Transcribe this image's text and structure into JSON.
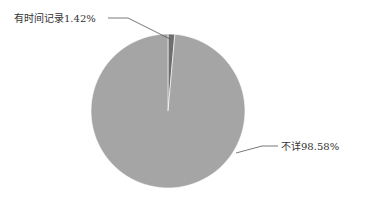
{
  "chart_data": {
    "type": "pie",
    "title": "",
    "categories": [
      "有时间记录",
      "不详"
    ],
    "values": [
      1.42,
      98.58
    ],
    "unit": "%",
    "labels": [
      "有时间记录1.42%",
      "不详98.58%"
    ],
    "colors": [
      "#6e6e6e",
      "#a5a5a5"
    ],
    "legend": "none",
    "start_angle_deg": 0,
    "direction": "clockwise"
  },
  "labels": {
    "slice1": "有时间记录1.42%",
    "slice2": "不详98.58%"
  }
}
